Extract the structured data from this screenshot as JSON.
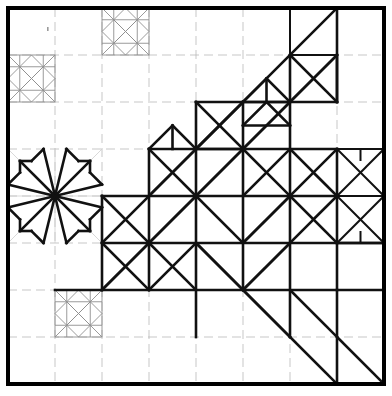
{
  "document": {
    "title": "Quilt Block Design Diagram",
    "type": "line-drawing",
    "background_color": "#ffffff",
    "width": 392,
    "height": 396
  },
  "colors": {
    "border": "#000000",
    "bold_stroke": "#111111",
    "motif_stroke": "#8e8e8e",
    "grid_stroke": "#b9b9b9",
    "faint_stroke": "#cfcfcf",
    "paper": "#ffffff"
  },
  "frame": {
    "name": "outer-border",
    "x": 8,
    "y": 8,
    "width": 376,
    "height": 376,
    "stroke_width": 4
  },
  "grid": {
    "name": "construction-grid",
    "columns": 8,
    "rows": 8,
    "cell_size": 47,
    "origin_x": 8,
    "origin_y": 8,
    "x_positions": [
      8,
      55,
      102,
      149,
      196,
      243,
      290,
      337,
      384
    ],
    "y_positions": [
      8,
      55,
      102,
      149,
      196,
      243,
      290,
      337,
      384
    ],
    "style": "dashed-light",
    "dash": "9 5"
  },
  "motifs": {
    "small_stars": [
      {
        "name": "star-top-left",
        "col": 0,
        "row": 1,
        "x": 8,
        "y": 55,
        "size": 47,
        "style": "light"
      },
      {
        "name": "star-top-center",
        "col": 2,
        "row": 0,
        "x": 102,
        "y": 8,
        "size": 47,
        "style": "light"
      },
      {
        "name": "star-bottom-left",
        "col": 1,
        "row": 6,
        "x": 55,
        "y": 290,
        "size": 47,
        "style": "light"
      }
    ],
    "large_stars": [
      {
        "name": "star-left-large",
        "x": 8,
        "y": 149,
        "size": 94,
        "style": "bold",
        "description": "eight-pointed LeMoyne star spanning 2x2 grid cells"
      },
      {
        "name": "star-right-large",
        "x": 337,
        "y": 149,
        "size": 94,
        "style": "bold",
        "description": "eight-pointed star clipped at right border"
      }
    ],
    "diagonal_band": {
      "name": "half-square-triangle-band",
      "description": "bold band of half-square triangles running from lower-left to upper-right",
      "start_cell": [
        0,
        7
      ],
      "end_cell": [
        7,
        0
      ],
      "style": "bold"
    }
  },
  "annotations": {
    "speck": {
      "name": "pencil-mark",
      "x": 47,
      "y": 27,
      "width": 1.6,
      "height": 4
    }
  },
  "legend": {
    "visible": false,
    "entries": []
  },
  "labels": {
    "visible_text": []
  }
}
